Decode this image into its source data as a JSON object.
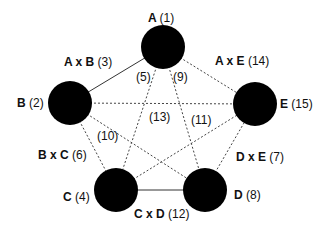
{
  "diagram": {
    "nodes": [
      {
        "id": "A",
        "label": "A",
        "value": "(1)",
        "cx": 163,
        "cy": 47,
        "r": 22
      },
      {
        "id": "B",
        "label": "B",
        "value": "(2)",
        "cx": 70,
        "cy": 103,
        "r": 22
      },
      {
        "id": "C",
        "label": "C",
        "value": "(4)",
        "cx": 116,
        "cy": 190,
        "r": 22
      },
      {
        "id": "D",
        "label": "D",
        "value": "(8)",
        "cx": 205,
        "cy": 190,
        "r": 22
      },
      {
        "id": "E",
        "label": "E",
        "value": "(15)",
        "cx": 255,
        "cy": 104,
        "r": 22
      }
    ],
    "edges": {
      "AB": {
        "label": "A x B",
        "value": "(3)",
        "style": "solid"
      },
      "AE": {
        "label": "A x E",
        "value": "(14)",
        "style": "dotted"
      },
      "BC": {
        "label": "B x C",
        "value": "(6)",
        "style": "dotted"
      },
      "CD": {
        "label": "C x D",
        "value": "(12)",
        "style": "solid"
      },
      "DE": {
        "label": "D x E",
        "value": "(7)",
        "style": "dotted"
      },
      "AC": {
        "value": "(5)",
        "style": "dotted"
      },
      "AD": {
        "value": "(9)",
        "style": "dotted"
      },
      "BD": {
        "value": "(10)",
        "style": "dotted"
      },
      "CE": {
        "value": "(11)",
        "style": "dotted"
      },
      "BE": {
        "value": "(13)",
        "style": "dotted"
      }
    },
    "colors": {
      "node": "#000000",
      "edge": "#333333",
      "background": "#ffffff"
    }
  }
}
